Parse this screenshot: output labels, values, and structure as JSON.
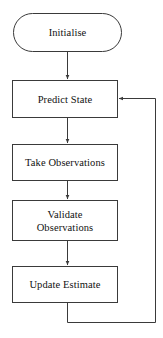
{
  "diagram": {
    "type": "flowchart",
    "orientation": "vertical-top-down",
    "background_color": "#ffffff",
    "stroke_color": "#3a3a3a",
    "text_color": "#111111",
    "nodes": [
      {
        "id": "initialise",
        "label": "Initialise",
        "shape": "stadium",
        "x": 13,
        "y": 13,
        "width": 109,
        "height": 39
      },
      {
        "id": "predict-state",
        "label": "Predict State",
        "shape": "rectangle",
        "x": 12,
        "y": 80,
        "width": 106,
        "height": 38
      },
      {
        "id": "take-observations",
        "label": "Take Observations",
        "shape": "rectangle",
        "x": 12,
        "y": 144,
        "width": 106,
        "height": 37
      },
      {
        "id": "validate-observations",
        "label": "Validate",
        "label_line2": "Observations",
        "shape": "rectangle",
        "x": 12,
        "y": 200,
        "width": 106,
        "height": 41
      },
      {
        "id": "update-estimate",
        "label": "Update Estimate",
        "shape": "rectangle",
        "x": 12,
        "y": 266,
        "width": 106,
        "height": 37
      }
    ],
    "edges": [
      {
        "id": "edge-initialise-predict",
        "from": "initialise",
        "to": "predict-state",
        "arrow": true
      },
      {
        "id": "edge-predict-take",
        "from": "predict-state",
        "to": "take-observations",
        "arrow": true
      },
      {
        "id": "edge-take-validate",
        "from": "take-observations",
        "to": "validate-observations",
        "arrow": true
      },
      {
        "id": "edge-validate-update",
        "from": "validate-observations",
        "to": "update-estimate",
        "arrow": true
      },
      {
        "id": "edge-feedback-loop",
        "from": "update-estimate",
        "to": "predict-state",
        "arrow": true,
        "routing": "down-right-up-left"
      }
    ]
  }
}
